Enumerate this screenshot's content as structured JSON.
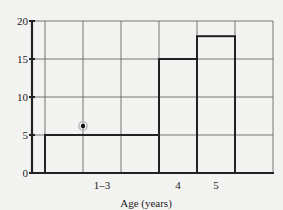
{
  "chart_data": {
    "type": "bar",
    "title": "",
    "xlabel": "Age (years)",
    "ylabel": "",
    "ylim": [
      0,
      20
    ],
    "yticks": [
      0,
      5,
      10,
      15,
      20
    ],
    "grid": true,
    "legend": null,
    "categories": [
      "1–3",
      "4",
      "5"
    ],
    "values": [
      5,
      15,
      18
    ],
    "bins": [
      {
        "label": "1–3",
        "x_start_col": 1,
        "x_end_col": 4,
        "value": 5
      },
      {
        "label": "4",
        "x_start_col": 4,
        "x_end_col": 5,
        "value": 15
      },
      {
        "label": "5",
        "x_start_col": 5,
        "x_end_col": 6,
        "value": 18
      }
    ],
    "annotations": [
      {
        "type": "point-marker",
        "x_col": 2,
        "y": 6.2,
        "description": "circled dot"
      }
    ]
  },
  "axis": {
    "x_title": "Age (years)",
    "x_tick_labels": [
      "1–3",
      "4",
      "5"
    ],
    "y_tick_labels": [
      "0",
      "5",
      "10",
      "15",
      "20"
    ]
  },
  "colors": {
    "background": "#f3f3f1",
    "grid": "#555555",
    "bars": "#222222",
    "axis": "#222222"
  }
}
